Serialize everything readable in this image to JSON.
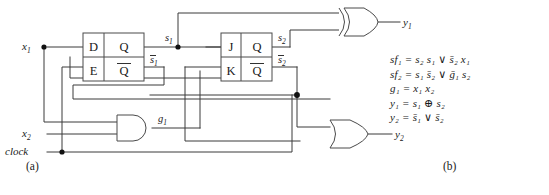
{
  "figure": {
    "caption_a": "(a)",
    "caption_b": "(b)"
  },
  "inputs": [
    {
      "name": "x1",
      "label": "x",
      "sub": "1"
    },
    {
      "name": "x2",
      "label": "x",
      "sub": "2"
    },
    {
      "name": "clock",
      "label": "clock",
      "sub": ""
    }
  ],
  "flipflops": {
    "d_ff": {
      "name": "d-flip-flop",
      "in_top": "D",
      "in_bottom": "E",
      "out_top": "Q",
      "out_bottom": "Q",
      "out_top_signal": "s",
      "out_top_sub": "1",
      "out_bottom_signal": "s",
      "out_bottom_sub": "1"
    },
    "jk_ff": {
      "name": "jk-flip-flop",
      "in_top": "J",
      "in_bottom": "K",
      "out_top": "Q",
      "out_bottom": "Q",
      "out_top_signal": "s",
      "out_top_sub": "2",
      "out_bottom_signal": "s",
      "out_bottom_sub": "2"
    }
  },
  "gates": [
    {
      "name": "and-gate-g1",
      "type": "AND",
      "output_label": "g",
      "output_sub": "1"
    },
    {
      "name": "xor-gate-y1",
      "type": "XOR",
      "output_label": "y",
      "output_sub": "1"
    },
    {
      "name": "or-gate-y2",
      "type": "OR",
      "output_label": "y",
      "output_sub": "2"
    }
  ],
  "outputs": [
    {
      "name": "y1",
      "label": "y",
      "sub": "1"
    },
    {
      "name": "y2",
      "label": "y",
      "sub": "2"
    }
  ],
  "equations": [
    {
      "name": "equation-sf1",
      "text": "sf₁ = s₂ s₁ ∨ s̄₂ x₁"
    },
    {
      "name": "equation-sf2",
      "text": "sf₂ = s₁ s̄₂ ∨ ḡ₁ s₂"
    },
    {
      "name": "equation-g1",
      "text": "g₁ = x₁ x₂"
    },
    {
      "name": "equation-y1",
      "text": "y₁ = s₁ ⊕ s₂"
    },
    {
      "name": "equation-y2",
      "text": "y₂ = s̄₁ ∨ s̄₂"
    }
  ],
  "colors": {
    "wire": "#3a3a3a",
    "gate_stroke": "#4a4a4a",
    "text": "#1a1a1a",
    "background": "#ffffff"
  }
}
